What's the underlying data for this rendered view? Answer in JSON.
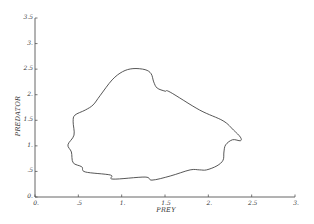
{
  "chart_data": {
    "type": "line",
    "title": "",
    "xlabel": "PREY",
    "ylabel": "PREDATOR",
    "xlim": [
      0,
      3
    ],
    "ylim": [
      0,
      3.5
    ],
    "grid": false,
    "legend": null,
    "x_ticks": [
      {
        "value": 0,
        "label": "0."
      },
      {
        "value": 0.5,
        "label": ".5"
      },
      {
        "value": 1,
        "label": "1."
      },
      {
        "value": 1.5,
        "label": "1.5"
      },
      {
        "value": 2,
        "label": "2."
      },
      {
        "value": 2.5,
        "label": "2.5"
      },
      {
        "value": 3,
        "label": "3."
      }
    ],
    "y_ticks": [
      {
        "value": 0,
        "label": "0."
      },
      {
        "value": 0.5,
        "label": ".5"
      },
      {
        "value": 1,
        "label": "1."
      },
      {
        "value": 1.5,
        "label": "1.5"
      },
      {
        "value": 2,
        "label": "2."
      },
      {
        "value": 2.5,
        "label": "2.5"
      },
      {
        "value": 3,
        "label": "3."
      },
      {
        "value": 3.5,
        "label": "3.5"
      }
    ],
    "series": [
      {
        "name": "predator-prey orbit",
        "closed": true,
        "x": [
          0.44,
          0.46,
          0.58,
          0.67,
          0.75,
          0.89,
          1.01,
          1.13,
          1.27,
          1.34,
          1.37,
          1.41,
          1.5,
          1.56,
          1.9,
          2.17,
          2.29,
          2.37,
          2.37,
          2.28,
          2.2,
          2.18,
          2.17,
          2.1,
          1.98,
          1.9,
          1.79,
          1.56,
          1.35,
          1.27,
          0.9,
          0.87,
          0.58,
          0.54,
          0.44,
          0.42,
          0.38,
          0.45,
          0.44
        ],
        "y": [
          1.47,
          1.6,
          1.7,
          1.8,
          1.98,
          2.29,
          2.45,
          2.51,
          2.49,
          2.41,
          2.25,
          2.13,
          2.07,
          2.05,
          1.7,
          1.49,
          1.31,
          1.17,
          1.1,
          1.12,
          1.02,
          0.88,
          0.72,
          0.61,
          0.53,
          0.53,
          0.53,
          0.41,
          0.33,
          0.39,
          0.35,
          0.43,
          0.49,
          0.59,
          0.67,
          0.88,
          1.02,
          1.21,
          1.47
        ]
      }
    ]
  }
}
